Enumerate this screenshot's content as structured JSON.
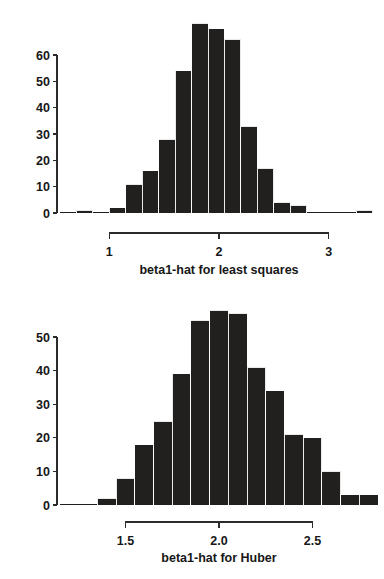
{
  "page": {
    "background_color": "#ffffff",
    "bar_color": "#22201f",
    "axis_color": "#2b2b2b",
    "text_color": "#171717"
  },
  "chart_data": [
    {
      "id": "least-squares",
      "type": "bar",
      "subtype": "histogram",
      "title": "",
      "xlabel": "beta1-hat for least squares",
      "ylabel": "",
      "grid": false,
      "legend": null,
      "xlim": [
        0.55,
        3.45
      ],
      "ylim": [
        0,
        72
      ],
      "xticks": [
        "1",
        "2",
        "3"
      ],
      "xtick_values": [
        1,
        2,
        3
      ],
      "yticks": [
        "0",
        "10",
        "20",
        "30",
        "40",
        "50",
        "60"
      ],
      "ytick_values": [
        0,
        10,
        20,
        30,
        40,
        50,
        60
      ],
      "bin_width": 0.15,
      "bin_starts": [
        0.55,
        0.7,
        0.85,
        1.0,
        1.15,
        1.3,
        1.45,
        1.6,
        1.75,
        1.9,
        2.05,
        2.2,
        2.35,
        2.5,
        2.65,
        2.8,
        2.95,
        3.1,
        3.25
      ],
      "bin_centers": [
        0.625,
        0.775,
        0.925,
        1.075,
        1.225,
        1.375,
        1.525,
        1.675,
        1.825,
        1.975,
        2.125,
        2.275,
        2.425,
        2.575,
        2.725,
        2.875,
        3.025,
        3.175,
        3.325
      ],
      "values": [
        0,
        1,
        0,
        2,
        11,
        16,
        28,
        54,
        72,
        70,
        66,
        33,
        17,
        4,
        3,
        0,
        0,
        0,
        1
      ]
    },
    {
      "id": "huber",
      "type": "bar",
      "subtype": "histogram",
      "title": "",
      "xlabel": "beta1-hat for Huber",
      "ylabel": "",
      "grid": false,
      "legend": null,
      "xlim": [
        1.15,
        2.85
      ],
      "ylim": [
        0,
        58
      ],
      "xticks": [
        "1.5",
        "2.0",
        "2.5"
      ],
      "xtick_values": [
        1.5,
        2.0,
        2.5
      ],
      "yticks": [
        "0",
        "10",
        "20",
        "30",
        "40",
        "50"
      ],
      "ytick_values": [
        0,
        10,
        20,
        30,
        40,
        50
      ],
      "bin_width": 0.1,
      "bin_starts": [
        1.15,
        1.25,
        1.35,
        1.45,
        1.55,
        1.65,
        1.75,
        1.85,
        1.95,
        2.05,
        2.15,
        2.25,
        2.35,
        2.45,
        2.55,
        2.65,
        2.75
      ],
      "bin_centers": [
        1.2,
        1.3,
        1.4,
        1.5,
        1.6,
        1.7,
        1.8,
        1.9,
        2.0,
        2.1,
        2.2,
        2.3,
        2.4,
        2.5,
        2.6,
        2.7,
        2.8
      ],
      "values": [
        0,
        0,
        2,
        8,
        18,
        25,
        39,
        55,
        58,
        57,
        41,
        34,
        21,
        20,
        10,
        3,
        3
      ]
    }
  ]
}
